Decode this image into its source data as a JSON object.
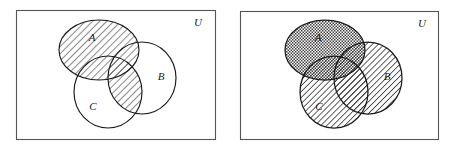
{
  "figure": {
    "type": "venn-diagram-pair",
    "width": 452,
    "height": 150,
    "background_color": "#ffffff",
    "stroke_color": "#1a1a1a"
  },
  "panels": [
    {
      "id": "left",
      "name": "venn-diagram-left",
      "universe_label": "U",
      "rect": {
        "x": 16,
        "y": 10,
        "width": 200,
        "height": 130
      },
      "rect_stroke": "#555555",
      "sets": [
        {
          "label": "A",
          "label_x": 92,
          "label_y": 41,
          "cx": 99,
          "cy": 50,
          "rx": 40,
          "ry": 30,
          "fill": "hatch-diagonal"
        },
        {
          "label": "B",
          "label_x": 161,
          "label_y": 80,
          "cx": 142,
          "cy": 78,
          "rx": 34,
          "ry": 36,
          "fill": "none"
        },
        {
          "label": "C",
          "label_x": 93,
          "label_y": 110,
          "cx": 108,
          "cy": 92,
          "rx": 34,
          "ry": 36,
          "fill": "none"
        }
      ],
      "shaded_description": "Set A fully shaded plus the intersection of B and C shaded",
      "shade_pattern": "diagonal-hatch"
    },
    {
      "id": "right",
      "name": "venn-diagram-right",
      "universe_label": "U",
      "rect": {
        "x": 14,
        "y": 11,
        "width": 199,
        "height": 129
      },
      "rect_stroke": "#555555",
      "sets": [
        {
          "label": "A",
          "label_x": 92,
          "label_y": 41,
          "cx": 99,
          "cy": 50,
          "rx": 40,
          "ry": 30,
          "fill": "cross-hatch"
        },
        {
          "label": "B",
          "label_x": 161,
          "label_y": 80,
          "cx": 142,
          "cy": 78,
          "rx": 34,
          "ry": 36,
          "fill": "diagonal-hatch"
        },
        {
          "label": "C",
          "label_x": 93,
          "label_y": 110,
          "cx": 108,
          "cy": 92,
          "rx": 34,
          "ry": 36,
          "fill": "diagonal-hatch"
        }
      ],
      "shaded_description": "Set A cross-hatched, sets B and C diagonally hatched, union of all three shaded",
      "shade_pattern": "mixed"
    }
  ],
  "labels": {
    "set_a": "A",
    "set_b": "B",
    "set_c": "C",
    "universe": "U"
  }
}
